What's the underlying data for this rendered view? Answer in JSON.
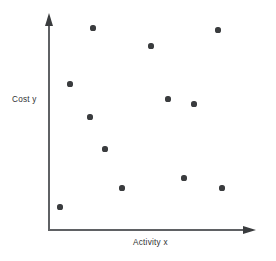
{
  "chart_data": {
    "type": "scatter",
    "title": "",
    "subtitle": "",
    "xlabel": "Activity x",
    "ylabel": "Cost y",
    "grid": false,
    "legend": null,
    "axes_style": "arrow-terminated open axes, no tick marks, no tick labels",
    "xlim": [
      0,
      1
    ],
    "ylim": [
      0,
      1
    ],
    "marker": {
      "shape": "circle",
      "color": "#3a3c3e",
      "size_px": 5.2
    },
    "n_points": 12,
    "points_px": [
      {
        "x": 93,
        "y": 28
      },
      {
        "x": 151,
        "y": 46
      },
      {
        "x": 218,
        "y": 30
      },
      {
        "x": 70,
        "y": 84
      },
      {
        "x": 168,
        "y": 99
      },
      {
        "x": 194,
        "y": 104
      },
      {
        "x": 90,
        "y": 117
      },
      {
        "x": 105,
        "y": 149
      },
      {
        "x": 184,
        "y": 178
      },
      {
        "x": 122,
        "y": 188
      },
      {
        "x": 222,
        "y": 188
      },
      {
        "x": 60,
        "y": 207
      }
    ],
    "x": [
      0.215,
      0.498,
      0.825,
      0.107,
      0.58,
      0.707,
      0.201,
      0.278,
      0.663,
      0.361,
      0.849,
      0.059
    ],
    "y": [
      0.976,
      0.888,
      0.966,
      0.707,
      0.634,
      0.61,
      0.549,
      0.393,
      0.252,
      0.203,
      0.203,
      0.111
    ],
    "colors": {
      "background": "#ffffff",
      "axis": "#5f6164",
      "arrowhead": "#3a3c3e",
      "marker": "#3a3c3e",
      "label_text": "#2f3133"
    }
  },
  "figure": {
    "y_axis_label": "Cost y",
    "x_axis_label": "Activity x"
  }
}
